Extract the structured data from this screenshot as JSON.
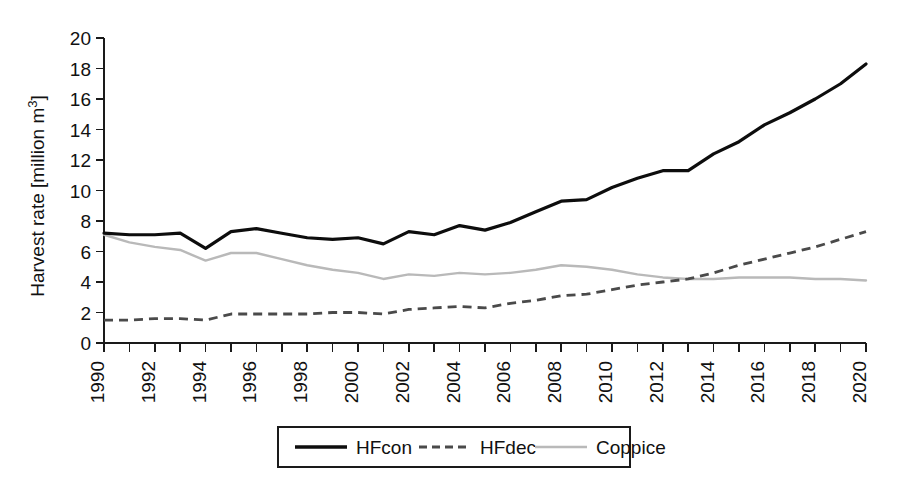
{
  "chart_data": {
    "type": "line",
    "title": "",
    "xlabel": "",
    "ylabel": "Harvest rate [million m3]",
    "ylabel_display": "Harvest rate [million m",
    "ylabel_superscript": "3",
    "ylabel_suffix": "]",
    "xlim": [
      1990,
      2020
    ],
    "ylim": [
      0,
      20
    ],
    "ytick_step": 2,
    "xtick_step": 1,
    "xtick_label_step": 2,
    "grid": false,
    "legend_position": "bottom-center",
    "yticks": [
      0,
      2,
      4,
      6,
      8,
      10,
      12,
      14,
      16,
      18,
      20
    ],
    "xticks": [
      1990,
      1991,
      1992,
      1993,
      1994,
      1995,
      1996,
      1997,
      1998,
      1999,
      2000,
      2001,
      2002,
      2003,
      2004,
      2005,
      2006,
      2007,
      2008,
      2009,
      2010,
      2011,
      2012,
      2013,
      2014,
      2015,
      2016,
      2017,
      2018,
      2019,
      2020
    ],
    "xtick_labels": [
      "1990",
      "1992",
      "1994",
      "1996",
      "1998",
      "2000",
      "2002",
      "2004",
      "2006",
      "2008",
      "2010",
      "2012",
      "2014",
      "2016",
      "2018",
      "2020"
    ],
    "ytick_labels": [
      "0",
      "2",
      "4",
      "6",
      "8",
      "10",
      "12",
      "14",
      "16",
      "18",
      "20"
    ],
    "x": [
      1990,
      1991,
      1992,
      1993,
      1994,
      1995,
      1996,
      1997,
      1998,
      1999,
      2000,
      2001,
      2002,
      2003,
      2004,
      2005,
      2006,
      2007,
      2008,
      2009,
      2010,
      2011,
      2012,
      2013,
      2014,
      2015,
      2016,
      2017,
      2018,
      2019,
      2020
    ],
    "series": [
      {
        "name": "HFcon",
        "style": "solid",
        "color": "#0d0d0d",
        "values": [
          7.2,
          7.1,
          7.1,
          7.2,
          6.2,
          7.3,
          7.5,
          7.2,
          6.9,
          6.8,
          6.9,
          6.5,
          7.3,
          7.1,
          7.7,
          7.4,
          7.9,
          8.6,
          9.3,
          9.4,
          10.2,
          10.8,
          11.3,
          11.3,
          12.4,
          13.2,
          14.3,
          15.1,
          16.0,
          17.0,
          18.3
        ]
      },
      {
        "name": "HFdec",
        "style": "dashed",
        "color": "#4a4a4a",
        "values": [
          1.5,
          1.5,
          1.6,
          1.6,
          1.5,
          1.9,
          1.9,
          1.9,
          1.9,
          2.0,
          2.0,
          1.9,
          2.2,
          2.3,
          2.4,
          2.3,
          2.6,
          2.8,
          3.1,
          3.2,
          3.5,
          3.8,
          4.0,
          4.2,
          4.6,
          5.1,
          5.5,
          5.9,
          6.3,
          6.8,
          7.3
        ]
      },
      {
        "name": "Coppice",
        "style": "solid-light",
        "color": "#b9b9b9",
        "values": [
          7.1,
          6.6,
          6.3,
          6.1,
          5.4,
          5.9,
          5.9,
          5.5,
          5.1,
          4.8,
          4.6,
          4.2,
          4.5,
          4.4,
          4.6,
          4.5,
          4.6,
          4.8,
          5.1,
          5.0,
          4.8,
          4.5,
          4.3,
          4.2,
          4.2,
          4.3,
          4.3,
          4.3,
          4.2,
          4.2,
          4.1
        ]
      }
    ]
  },
  "legend": {
    "entries": [
      {
        "label": "HFcon",
        "icon": "solid-line-swatch"
      },
      {
        "label": "HFdec",
        "icon": "dashed-line-swatch"
      },
      {
        "label": "Coppice",
        "icon": "light-line-swatch"
      }
    ]
  }
}
